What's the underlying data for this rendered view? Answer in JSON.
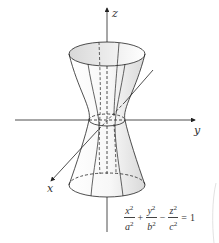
{
  "figure": {
    "axes": {
      "x_label": "x",
      "y_label": "y",
      "z_label": "z"
    },
    "equation": {
      "terms": [
        {
          "num": "x",
          "den": "a",
          "power": "2"
        },
        {
          "num": "y",
          "den": "b",
          "power": "2"
        },
        {
          "num": "z",
          "den": "c",
          "power": "2"
        }
      ],
      "ops": [
        "+",
        "−",
        "="
      ],
      "rhs": "1",
      "full_text": "x²/a² + y²/b² − z²/c² = 1"
    },
    "colors": {
      "line": "#222222",
      "surface_shade": "#e6e6e6",
      "background": "#ffffff"
    }
  }
}
